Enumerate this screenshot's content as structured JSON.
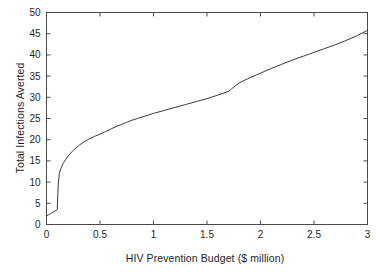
{
  "chart_data": {
    "type": "line",
    "title": "",
    "xlabel": "HIV Prevention Budget ($ million)",
    "ylabel": "Total Infections Averted",
    "xlim": [
      0,
      3
    ],
    "ylim": [
      0,
      50
    ],
    "xticks": [
      0,
      0.5,
      1,
      1.5,
      2,
      2.5,
      3
    ],
    "xticklabels": [
      "0",
      "0.5",
      "1",
      "1.5",
      "2",
      "2.5",
      "3"
    ],
    "yticks": [
      0,
      5,
      10,
      15,
      20,
      25,
      30,
      35,
      40,
      45,
      50
    ],
    "yticklabels": [
      "0",
      "5",
      "10",
      "15",
      "20",
      "25",
      "30",
      "35",
      "40",
      "45",
      "50"
    ],
    "grid": false,
    "legend": null,
    "tick_direction": "in",
    "frame": "box",
    "line_color": "#3a3a3a",
    "line_width": 1,
    "series": [
      {
        "name": "Total infections averted",
        "x": [
          0.0,
          0.02,
          0.04,
          0.06,
          0.08,
          0.095,
          0.1,
          0.105,
          0.11,
          0.12,
          0.14,
          0.16,
          0.18,
          0.2,
          0.25,
          0.3,
          0.35,
          0.4,
          0.45,
          0.5,
          0.55,
          0.6,
          0.65,
          0.7,
          0.75,
          0.8,
          0.85,
          0.9,
          0.95,
          1.0,
          1.1,
          1.2,
          1.3,
          1.4,
          1.5,
          1.6,
          1.7,
          1.72,
          1.8,
          1.9,
          2.0,
          2.1,
          2.2,
          2.3,
          2.4,
          2.5,
          2.6,
          2.7,
          2.8,
          2.9,
          3.0
        ],
        "y": [
          2.0,
          2.3,
          2.6,
          2.9,
          3.2,
          3.4,
          3.5,
          6.5,
          9.5,
          12.0,
          13.6,
          14.6,
          15.4,
          16.1,
          17.5,
          18.6,
          19.5,
          20.2,
          20.8,
          21.3,
          21.9,
          22.5,
          23.1,
          23.6,
          24.1,
          24.6,
          25.0,
          25.4,
          25.8,
          26.2,
          26.9,
          27.6,
          28.3,
          29.0,
          29.7,
          30.5,
          31.4,
          31.8,
          33.4,
          34.6,
          35.7,
          36.8,
          37.8,
          38.8,
          39.7,
          40.6,
          41.5,
          42.4,
          43.4,
          44.5,
          45.8
        ]
      }
    ]
  },
  "axes": {
    "x_title": "HIV Prevention Budget ($ million)",
    "y_title": "Total Infections Averted"
  }
}
